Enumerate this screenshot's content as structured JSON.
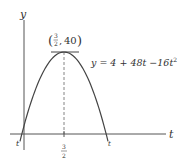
{
  "chart_data": {
    "type": "line",
    "title": "",
    "equation": "y = 4 + 48t −16t²",
    "equation_parts": {
      "prefix": "y = 4 + 48t −16t",
      "exp": "2"
    },
    "xlabel": "t",
    "ylabel": "y",
    "vertex": {
      "t": 1.5,
      "y": 40,
      "label_t": "3/2",
      "label_y": "40"
    },
    "tick_labels": {
      "x_mid": {
        "num": "3",
        "den": "2"
      },
      "x_left": "t",
      "x_right": "t"
    },
    "x": [
      -0.078,
      0,
      0.25,
      0.5,
      0.75,
      1.0,
      1.25,
      1.5,
      1.75,
      2.0,
      2.25,
      2.5,
      2.75,
      3.0,
      3.078
    ],
    "values": [
      0,
      4,
      15,
      24,
      31,
      36,
      39,
      40,
      39,
      36,
      31,
      24,
      15,
      4,
      0
    ],
    "xlim": [
      -0.3,
      3.7
    ],
    "ylim": [
      -4,
      46
    ],
    "grid": false,
    "legend": "none",
    "annotations": [
      "horizontal tangent at vertex",
      "dashed vertical line at t = 3/2"
    ]
  }
}
